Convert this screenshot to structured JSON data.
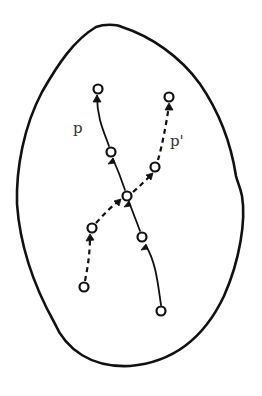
{
  "figure": {
    "colors": {
      "stroke": "#111111",
      "background": "#ffffff",
      "label": "#333333"
    },
    "outline": {
      "shape": "irregular-oval",
      "top": [
        108,
        25
      ],
      "bottom": [
        128,
        366
      ],
      "left": [
        17,
        200
      ],
      "right": [
        243,
        200
      ]
    },
    "paths": [
      {
        "id": "p",
        "label": "p",
        "style": "solid",
        "label_position": [
          79,
          133
        ],
        "nodes": [
          [
            161,
            311
          ],
          [
            142,
            237
          ],
          [
            127,
            196
          ],
          [
            111,
            152
          ],
          [
            98,
            89
          ]
        ]
      },
      {
        "id": "p_prime",
        "label": "p'",
        "style": "dashed",
        "label_position": [
          172,
          146
        ],
        "nodes": [
          [
            84,
            287
          ],
          [
            92,
            228
          ],
          [
            127,
            196
          ],
          [
            155,
            167
          ],
          [
            169,
            97
          ]
        ]
      }
    ],
    "crossing_node": [
      127,
      196
    ]
  }
}
